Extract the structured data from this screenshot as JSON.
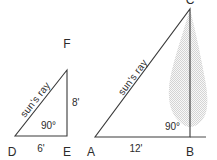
{
  "figure": {
    "background_color": "#ffffff",
    "line_color": "#3a3a3a",
    "text_color": "#2b2b2b",
    "shade_color": "#d8d8d8"
  },
  "small_triangle": {
    "name": "small-triangle-def",
    "vertices": {
      "bottom_left": "D",
      "bottom_right": "E",
      "top_right": "F"
    },
    "ray_label": "sun's ray",
    "vertical_measure": "8'",
    "base_measure": "6'",
    "right_angle": "90°"
  },
  "large_triangle": {
    "name": "large-triangle-abc",
    "vertices": {
      "bottom_left": "A",
      "bottom_right": "B",
      "top_right": "C"
    },
    "ray_label": "sun's ray",
    "base_measure": "12'",
    "right_angle": "90°",
    "shaded_object": "tree-silhouette"
  }
}
